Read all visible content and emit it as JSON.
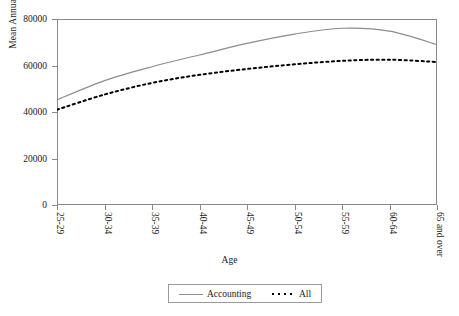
{
  "chart_data": {
    "type": "line",
    "title": "",
    "xlabel": "Age",
    "ylabel": "Mean Annual Earnings",
    "categories": [
      "25-29",
      "30-34",
      "35-39",
      "40-44",
      "45-49",
      "50-54",
      "55-59",
      "60-64",
      "65 and over"
    ],
    "ylim": [
      0,
      80000
    ],
    "yticks": [
      0,
      20000,
      40000,
      60000,
      80000
    ],
    "ytick_labels": [
      "0",
      "20000",
      "40000",
      "60000",
      "80000"
    ],
    "grid": false,
    "legend_position": "bottom-center",
    "series": [
      {
        "name": "Accounting",
        "style": "solid",
        "color": "#8c8c8c",
        "values": [
          45200,
          53500,
          59500,
          64500,
          69500,
          73500,
          76000,
          74800,
          69000
        ]
      },
      {
        "name": "All",
        "style": "dotted",
        "color": "#000000",
        "values": [
          41000,
          47500,
          52500,
          56000,
          58500,
          60500,
          62000,
          62500,
          61500
        ]
      }
    ],
    "annotations": []
  },
  "legend": {
    "items": [
      {
        "label": "Accounting",
        "style": "solid"
      },
      {
        "label": "All",
        "style": "dotted"
      }
    ]
  }
}
